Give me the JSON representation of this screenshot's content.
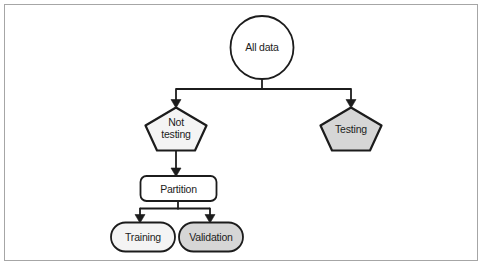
{
  "figure": {
    "type": "flowchart",
    "background_color": "#ffffff",
    "frame_border_color": "#a6a6a6",
    "stroke_color": "#1c1c1c",
    "text_color": "#1c1c1c",
    "nodes": {
      "all_data": {
        "label": "All data",
        "shape": "circle",
        "fill": "#ffffff"
      },
      "not_testing": {
        "line1": "Not",
        "line2": "testing",
        "shape": "pentagon",
        "fill": "#f4f4f4"
      },
      "testing": {
        "label": "Testing",
        "shape": "pentagon",
        "fill": "#d6d6d6"
      },
      "partition": {
        "label": "Partition",
        "shape": "rounded-rect",
        "fill": "#ffffff"
      },
      "training": {
        "label": "Training",
        "shape": "stadium",
        "fill": "#f4f4f4"
      },
      "validation": {
        "label": "Validation",
        "shape": "stadium",
        "fill": "#d6d6d6"
      }
    },
    "edges": [
      {
        "from": "all_data",
        "to": "not_testing"
      },
      {
        "from": "all_data",
        "to": "testing"
      },
      {
        "from": "not_testing",
        "to": "partition"
      },
      {
        "from": "partition",
        "to": "training"
      },
      {
        "from": "partition",
        "to": "validation"
      }
    ]
  }
}
